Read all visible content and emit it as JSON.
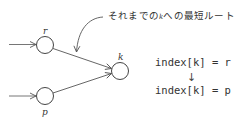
{
  "diagram": {
    "nodes": [
      {
        "id": "r",
        "label": "r",
        "cx": 45,
        "cy": 45
      },
      {
        "id": "p",
        "label": "p",
        "cx": 45,
        "cy": 96
      },
      {
        "id": "k",
        "label": "k",
        "cx": 120,
        "cy": 71
      }
    ],
    "edges": [
      {
        "from": "r",
        "to": "k"
      },
      {
        "from": "p",
        "to": "k"
      }
    ],
    "annotation": {
      "prefix": "それまでの",
      "k": "k",
      "suffix": "への最短ルート"
    },
    "code": {
      "line1": "index[k] = r",
      "arrow": "↓",
      "line2": "index[k] = p"
    },
    "colors": {
      "stroke": "#555555",
      "text": "#333333"
    }
  }
}
